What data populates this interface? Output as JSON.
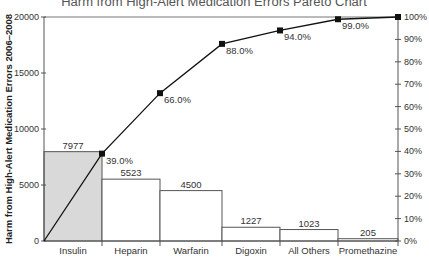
{
  "chart_data": {
    "type": "bar",
    "subtype": "pareto",
    "title": "Harm from High-Alert Medication Errors Pareto Chart",
    "xlabel": "",
    "ylabel": "Harm from High-Alert Medication Errors 2006–2008",
    "y2label": "",
    "categories": [
      "Insulin",
      "Heparin",
      "Warfarin",
      "Digoxin",
      "All Others",
      "Promethazine"
    ],
    "series": [
      {
        "name": "Harm count",
        "type": "bar",
        "axis": "left",
        "values": [
          7977,
          5523,
          4500,
          1227,
          1023,
          205
        ]
      },
      {
        "name": "Cumulative %",
        "type": "line",
        "axis": "right",
        "values": [
          39.0,
          66.0,
          88.0,
          94.0,
          99.0,
          100.0
        ],
        "labels": [
          "39.0%",
          "66.0%",
          "88.0%",
          "94.0%",
          "99.0%",
          ""
        ]
      }
    ],
    "ylim": [
      0,
      20000
    ],
    "yticks": [
      "0",
      "5000",
      "10000",
      "15000",
      "20000"
    ],
    "y2lim": [
      0,
      100
    ],
    "y2ticks": [
      "0%",
      "10%",
      "20%",
      "30%",
      "40%",
      "50%",
      "60%",
      "70%",
      "80%",
      "90%",
      "100%"
    ],
    "grid": false,
    "legend": "none",
    "highlight_color": "#d9d9d9",
    "bar_color": "#ffffff",
    "line_color": "#111111"
  }
}
